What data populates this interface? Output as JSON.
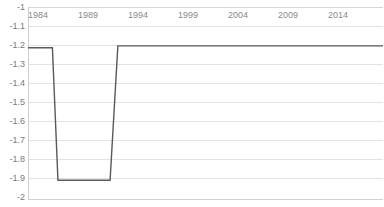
{
  "chart_data": {
    "type": "line",
    "title": "",
    "subtitle": "",
    "xlabel": "",
    "ylabel": "",
    "xlim": [
      1984,
      2016
    ],
    "ylim": [
      -2,
      -1
    ],
    "grid": true,
    "legend": false,
    "legend_position": "none",
    "x_tick_labels": [
      "1984",
      "1989",
      "1994",
      "1999",
      "2004",
      "2009",
      "2014"
    ],
    "x_ticks": [
      1984,
      1989,
      1994,
      1999,
      2004,
      2009,
      2014
    ],
    "y_tick_labels": [
      "-1",
      "-1.1",
      "-1.2",
      "-1.3",
      "-1.4",
      "-1.5",
      "-1.6",
      "-1.7",
      "-1.8",
      "-1.9",
      "-2"
    ],
    "y_ticks": [
      -1,
      -1.1,
      -1.2,
      -1.3,
      -1.4,
      -1.5,
      -1.6,
      -1.7,
      -1.8,
      -1.9,
      -2
    ],
    "x_axis_position": "top",
    "series": [
      {
        "name": "series-1",
        "color": "#595959",
        "x": [
          1984,
          1986.2,
          1986.7,
          1991.4,
          1992.1,
          2016
        ],
        "values": [
          -1.21,
          -1.21,
          -1.9,
          -1.9,
          -1.2,
          -1.2
        ]
      }
    ]
  },
  "watermark": {
    "text": ""
  }
}
